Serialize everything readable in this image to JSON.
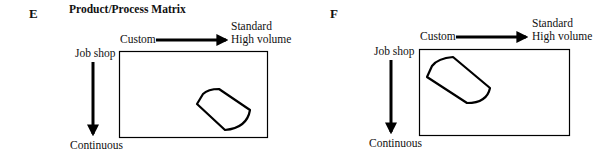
{
  "panels": [
    {
      "id": "E",
      "label": "E",
      "title": "Product/Process Matrix",
      "x_axis": {
        "start": "Custom",
        "end_line1": "Standard",
        "end_line2": "High volume"
      },
      "y_axis": {
        "start": "Job shop",
        "end": "Continuous"
      },
      "region": "lower-right (high volume, continuous)"
    },
    {
      "id": "F",
      "label": "F",
      "title": "",
      "x_axis": {
        "start": "Custom",
        "end_line1": "Standard",
        "end_line2": "High volume"
      },
      "y_axis": {
        "start": "Job shop",
        "end": "Continuous"
      },
      "region": "upper-left (custom, job shop)"
    }
  ],
  "colors": {
    "stroke": "#000000",
    "background": "#ffffff"
  }
}
